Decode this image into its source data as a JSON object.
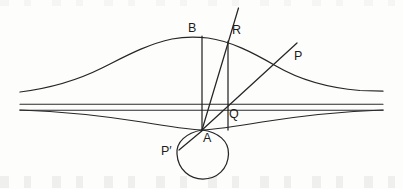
{
  "figure": {
    "type": "geometric-diagram",
    "title": "",
    "background_color": "#fdfdfc",
    "stroke_color": "#262626",
    "width": 403,
    "height": 189,
    "labels": [
      {
        "key": "B",
        "text": "B",
        "x": 188,
        "y": 22
      },
      {
        "key": "R",
        "text": "R",
        "x": 232,
        "y": 24
      },
      {
        "key": "P",
        "text": "P",
        "x": 294,
        "y": 50
      },
      {
        "key": "Q",
        "text": "Q",
        "x": 229,
        "y": 108
      },
      {
        "key": "A",
        "text": "A",
        "x": 203,
        "y": 132
      },
      {
        "key": "Pp",
        "text": "P′",
        "x": 161,
        "y": 145
      }
    ],
    "points": {
      "A": {
        "x": 202,
        "y": 130
      },
      "B": {
        "x": 202,
        "y": 37
      },
      "R": {
        "x": 228,
        "y": 42
      },
      "Q": {
        "x": 228,
        "y": 107
      },
      "P": {
        "x": 270,
        "y": 63
      },
      "P_prime": {
        "x": 182,
        "y": 148
      }
    },
    "curves": {
      "bell_upper": {
        "description": "cardioid upper bell curve",
        "left_end": {
          "x": 20,
          "y": 92
        },
        "peak": {
          "x": 190,
          "y": 37
        },
        "right_end": {
          "x": 383,
          "y": 91
        }
      },
      "bell_lower": {
        "description": "shallow lower curve meeting at A",
        "left_end": {
          "x": 20,
          "y": 110
        },
        "cusp": {
          "x": 202,
          "y": 130
        },
        "right_end": {
          "x": 383,
          "y": 110
        }
      },
      "axis_upper": {
        "y": 104,
        "x1": 20,
        "x2": 383
      },
      "axis_lower": {
        "y": 110,
        "x1": 20,
        "x2": 383
      },
      "loop": {
        "description": "closed loop / small circle below A",
        "center_x": 203,
        "center_y": 155,
        "radius": 25
      }
    },
    "rays": [
      {
        "name": "ray-A-R",
        "from": "A",
        "through": "R",
        "tip_x": 238,
        "tip_y": 8
      },
      {
        "name": "ray-A-P",
        "from": "A",
        "through": "P",
        "tip_x": 297,
        "tip_y": 43
      },
      {
        "name": "segment-B-A",
        "from": "B",
        "to": "A"
      },
      {
        "name": "segment-R-Q",
        "from": "R",
        "to": "Q"
      },
      {
        "name": "segment-A-Pprime",
        "from": "A",
        "to": "P_prime"
      }
    ]
  }
}
